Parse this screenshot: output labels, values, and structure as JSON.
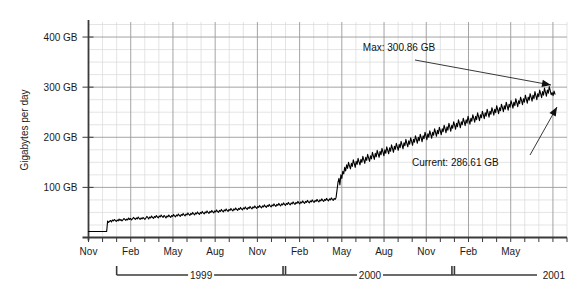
{
  "chart_data": {
    "type": "line",
    "title": "",
    "subtitle": "",
    "xlabel": "",
    "ylabel": "Gigabytes per day",
    "ylim": [
      0,
      430
    ],
    "xlim": [
      0,
      34
    ],
    "grid": true,
    "legend": false,
    "y_ticks": [
      {
        "value": 100,
        "label": "100 GB"
      },
      {
        "value": 200,
        "label": "200 GB"
      },
      {
        "value": 300,
        "label": "300 GB"
      },
      {
        "value": 400,
        "label": "400 GB"
      }
    ],
    "y_minor_step": 25,
    "x_tick_labels": [
      {
        "index": 0,
        "label": "Nov"
      },
      {
        "index": 3,
        "label": "Feb"
      },
      {
        "index": 6,
        "label": "May"
      },
      {
        "index": 9,
        "label": "Aug"
      },
      {
        "index": 12,
        "label": "Nov"
      },
      {
        "index": 15,
        "label": "Feb"
      },
      {
        "index": 18,
        "label": "May"
      },
      {
        "index": 21,
        "label": "Aug"
      },
      {
        "index": 24,
        "label": "Nov"
      },
      {
        "index": 27,
        "label": "Feb"
      },
      {
        "index": 30,
        "label": "May"
      }
    ],
    "year_brackets": [
      {
        "label": "1999",
        "start_index": 2,
        "end_index": 14
      },
      {
        "label": "2000",
        "start_index": 14,
        "end_index": 26
      },
      {
        "label": "2001",
        "start_index": 26,
        "end_index": 33
      }
    ],
    "annotations": [
      {
        "name": "max",
        "text": "Max: 300.86 GB",
        "value": 300.86
      },
      {
        "name": "current",
        "text": "Current: 286.61 GB",
        "value": 286.61
      }
    ],
    "series": [
      {
        "name": "Gigabytes per day",
        "color": "#000000",
        "values": [
          12,
          12,
          12,
          12,
          12,
          12,
          12,
          12,
          12,
          12,
          12,
          12,
          12,
          12,
          12,
          12,
          12,
          12,
          12,
          12,
          33,
          30,
          32,
          34,
          31,
          35,
          33,
          36,
          34,
          32,
          35,
          33,
          37,
          34,
          36,
          33,
          35,
          38,
          36,
          34,
          37,
          35,
          39,
          36,
          38,
          35,
          37,
          40,
          38,
          36,
          39,
          37,
          41,
          38,
          36,
          39,
          37,
          40,
          38,
          36,
          39,
          42,
          40,
          37,
          41,
          39,
          43,
          40,
          38,
          42,
          40,
          44,
          41,
          39,
          43,
          41,
          45,
          42,
          40,
          44,
          42,
          39,
          43,
          41,
          45,
          42,
          40,
          44,
          42,
          46,
          43,
          41,
          45,
          43,
          47,
          44,
          42,
          46,
          44,
          48,
          45,
          43,
          47,
          45,
          49,
          46,
          44,
          48,
          46,
          50,
          47,
          45,
          49,
          47,
          51,
          48,
          46,
          50,
          48,
          52,
          49,
          47,
          51,
          49,
          53,
          50,
          48,
          52,
          50,
          54,
          51,
          49,
          53,
          51,
          55,
          52,
          50,
          54,
          52,
          56,
          53,
          51,
          55,
          53,
          57,
          54,
          52,
          56,
          54,
          58,
          55,
          53,
          57,
          55,
          59,
          56,
          54,
          58,
          56,
          60,
          57,
          55,
          59,
          57,
          61,
          58,
          56,
          60,
          58,
          62,
          59,
          57,
          61,
          59,
          63,
          60,
          58,
          62,
          60,
          64,
          61,
          59,
          63,
          61,
          65,
          62,
          60,
          64,
          62,
          66,
          63,
          61,
          65,
          63,
          67,
          64,
          62,
          66,
          64,
          68,
          65,
          63,
          67,
          65,
          69,
          66,
          64,
          68,
          66,
          70,
          67,
          65,
          69,
          67,
          71,
          68,
          66,
          70,
          68,
          72,
          69,
          67,
          71,
          69,
          73,
          70,
          68,
          72,
          70,
          74,
          71,
          69,
          73,
          71,
          75,
          72,
          70,
          74,
          72,
          76,
          73,
          71,
          75,
          73,
          77,
          74,
          72,
          76,
          74,
          78,
          75,
          73,
          77,
          75,
          79,
          76,
          74,
          78,
          76,
          80,
          95,
          110,
          118,
          105,
          125,
          118,
          132,
          127,
          140,
          133,
          145,
          138,
          150,
          143,
          137,
          148,
          142,
          155,
          148,
          140,
          152,
          146,
          158,
          151,
          145,
          156,
          150,
          162,
          155,
          148,
          160,
          154,
          166,
          159,
          152,
          163,
          157,
          170,
          163,
          156,
          168,
          161,
          174,
          167,
          160,
          172,
          165,
          178,
          171,
          163,
          175,
          168,
          181,
          174,
          167,
          179,
          172,
          185,
          178,
          170,
          182,
          176,
          188,
          181,
          174,
          186,
          179,
          192,
          185,
          177,
          189,
          183,
          196,
          188,
          181,
          193,
          186,
          199,
          192,
          184,
          196,
          190,
          203,
          196,
          188,
          200,
          193,
          206,
          199,
          191,
          203,
          197,
          210,
          203,
          195,
          207,
          200,
          213,
          206,
          198,
          210,
          204,
          217,
          210,
          202,
          214,
          207,
          220,
          213,
          205,
          217,
          211,
          224,
          217,
          209,
          221,
          214,
          228,
          220,
          212,
          224,
          218,
          231,
          224,
          216,
          228,
          221,
          235,
          227,
          219,
          231,
          225,
          238,
          231,
          223,
          235,
          228,
          242,
          234,
          226,
          238,
          232,
          245,
          238,
          230,
          242,
          235,
          249,
          241,
          233,
          245,
          239,
          252,
          245,
          237,
          249,
          242,
          256,
          248,
          240,
          252,
          246,
          259,
          252,
          244,
          256,
          249,
          263,
          255,
          247,
          259,
          253,
          266,
          259,
          251,
          263,
          256,
          270,
          262,
          254,
          266,
          260,
          273,
          266,
          258,
          270,
          263,
          277,
          269,
          261,
          273,
          267,
          280,
          273,
          265,
          277,
          270,
          284,
          276,
          268,
          280,
          274,
          287,
          280,
          272,
          284,
          277,
          291,
          283,
          275,
          287,
          281,
          294,
          287,
          279,
          291,
          284,
          298,
          290,
          282,
          294,
          288,
          301,
          293,
          285,
          289,
          283,
          292,
          286
        ]
      }
    ]
  },
  "axis_labels": {
    "y_title": "Gigabytes per day"
  },
  "colors": {
    "line": "#000000",
    "axis": "#3a3a3a",
    "grid_major": "#9a9a9a",
    "grid_minor": "#d8d8d8",
    "background": "#ffffff",
    "text": "#1a1a1a"
  }
}
